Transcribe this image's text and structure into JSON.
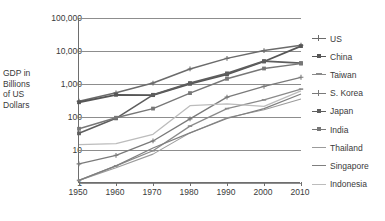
{
  "chart_data": {
    "type": "line",
    "title": "",
    "xlabel": "Year",
    "ylabel": "GDP in Billions of US Dollars",
    "ylabel_lines": [
      "GDP in",
      "Billions",
      "of US",
      "Dollars"
    ],
    "yscale": "log",
    "ylim": [
      1,
      100000
    ],
    "ytick_labels": [
      "100,000",
      "10,000",
      "1,000",
      "100",
      "10",
      "1"
    ],
    "ytick_values": [
      100000,
      10000,
      1000,
      100,
      10,
      1
    ],
    "xtick_labels": [
      "1950",
      "1960",
      "1970",
      "1980",
      "1990",
      "2000",
      "2010"
    ],
    "x": [
      1950,
      1960,
      1970,
      1980,
      1990,
      2000,
      2010
    ],
    "grid": "horizontal",
    "legend_position": "right",
    "series": [
      {
        "name": "US",
        "color": "#6b6b6b",
        "marker": "plus",
        "width": 1.5,
        "values": [
          300,
          540,
          1070,
          2860,
          5980,
          10280,
          14960
        ]
      },
      {
        "name": "China",
        "color": "#565656",
        "marker": "square",
        "width": 1.8,
        "values": [
          280,
          470,
          460,
          1010,
          1950,
          4800,
          14100
        ]
      },
      {
        "name": "Taiwan",
        "color": "#8a8a8a",
        "marker": "dash",
        "width": 1.3,
        "values": [
          1.2,
          3.3,
          9.5,
          53,
          180,
          330,
          700
        ]
      },
      {
        "name": "S. Korea",
        "color": "#7a7a7a",
        "marker": "cross",
        "width": 1.3,
        "values": [
          3.8,
          6.9,
          18.8,
          88,
          400,
          850,
          1600
        ]
      },
      {
        "name": "Japan",
        "color": "#5e5e5e",
        "marker": "square",
        "width": 1.6,
        "values": [
          32,
          91,
          470,
          1070,
          2100,
          4950,
          4280
        ]
      },
      {
        "name": "India",
        "color": "#777777",
        "marker": "square",
        "width": 1.4,
        "values": [
          44,
          95,
          180,
          530,
          1440,
          2950,
          4150
        ]
      },
      {
        "name": "Thailand",
        "color": "#9b9b9b",
        "marker": "none",
        "width": 1.1,
        "values": [
          1.2,
          2.9,
          7.5,
          33,
          95,
          165,
          350
        ]
      },
      {
        "name": "Singapore",
        "color": "#7f7f7f",
        "marker": "none",
        "width": 1.2,
        "values": [
          1.2,
          3.3,
          11.5,
          33,
          90,
          180,
          500
        ]
      },
      {
        "name": "Indonesia",
        "color": "#bcbcbc",
        "marker": "none",
        "width": 1.3,
        "values": [
          14.5,
          15.5,
          30,
          220,
          250,
          210,
          620
        ]
      }
    ]
  },
  "legend": {
    "items": [
      {
        "label": "US"
      },
      {
        "label": "China"
      },
      {
        "label": "Taiwan"
      },
      {
        "label": "S. Korea"
      },
      {
        "label": "Japan"
      },
      {
        "label": "India"
      },
      {
        "label": "Thailand"
      },
      {
        "label": "Singapore"
      },
      {
        "label": "Indonesia"
      }
    ]
  }
}
